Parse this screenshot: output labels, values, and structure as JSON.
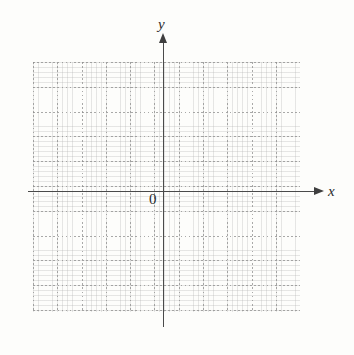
{
  "figure": {
    "kind": "cartesian-coordinate-grid",
    "background_color": "#fdfdfb"
  },
  "axes": {
    "x_label": "x",
    "y_label": "y",
    "origin_label": "0",
    "axis_color": "#4a4a4a",
    "arrowhead_color": "#3f3f3f"
  },
  "grid": {
    "line_color": "#8c8c8c",
    "style": "dotted",
    "major_cell_px": 24
  },
  "chart_data": {
    "type": "scatter",
    "title": "",
    "subtitle": "",
    "xlabel": "x",
    "ylabel": "y",
    "origin_label": "0",
    "grid": true,
    "grid_style": "dotted",
    "legend": "none",
    "series": [
      {
        "name": "",
        "x": [],
        "y": []
      }
    ],
    "x": [],
    "values": [],
    "categories": [],
    "xlim": [
      -5.4,
      5.6
    ],
    "ylim": [
      -4.8,
      5.2
    ],
    "xticks": [],
    "yticks": [],
    "xticklabels": [],
    "yticklabels": [],
    "annotations": [],
    "note": "Empty graph-paper axes with no plotted data points."
  }
}
